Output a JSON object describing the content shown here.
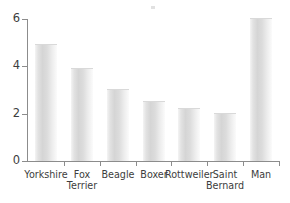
{
  "chart_data": {
    "type": "bar",
    "title": "",
    "subtitle": "",
    "xlabel": "",
    "ylabel": "",
    "categories": [
      "Yorkshire",
      "Fox Terrier",
      "Beagle",
      "Boxer",
      "Rottweiler",
      "Saint\nBernard",
      "Man"
    ],
    "values": [
      4.9,
      3.9,
      3.0,
      2.5,
      2.2,
      2.0,
      6.0
    ],
    "ylim": [
      0,
      6
    ],
    "yticks": [
      0,
      2,
      4,
      6
    ],
    "ytick_labels": [
      "0",
      "2",
      "4",
      "6"
    ],
    "grid": false,
    "legend": false,
    "legend_position": "none",
    "bar_color": "#dcdcdc",
    "axis_color": "#8c8c8c",
    "text_color": "#3d3d3d",
    "background": "#ffffff"
  },
  "axes": {
    "y": {
      "ticks": [
        {
          "label": "6",
          "value": 6
        },
        {
          "label": "4",
          "value": 4
        },
        {
          "label": "2",
          "value": 2
        },
        {
          "label": "0",
          "value": 0
        }
      ]
    },
    "x": {
      "ticks": [
        {
          "label": "Yorkshire"
        },
        {
          "label": "Fox Terrier"
        },
        {
          "label": "Beagle"
        },
        {
          "label": "Boxer"
        },
        {
          "label": "Rottweiler"
        },
        {
          "label": "Saint\nBernard"
        },
        {
          "label": "Man"
        }
      ]
    }
  }
}
